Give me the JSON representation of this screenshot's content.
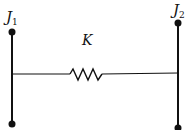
{
  "diagram": {
    "type": "two-inertia spring system",
    "left_body": {
      "label": "J",
      "subscript": "1"
    },
    "right_body": {
      "label": "J",
      "subscript": "2"
    },
    "spring": {
      "label": "K"
    },
    "colors": {
      "ink": "#111111",
      "background": "#ffffff"
    }
  }
}
